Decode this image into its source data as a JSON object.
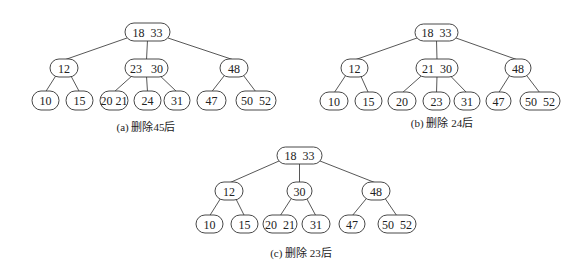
{
  "figure": {
    "trees": [
      {
        "id": "a",
        "caption": "(a) 删除45后",
        "caption_pos": [
          146,
          127
        ],
        "nodes": [
          {
            "id": "root",
            "label": "18  33",
            "x": 125,
            "y": 23,
            "w": 45,
            "h": 18
          },
          {
            "id": "n12",
            "label": "12",
            "x": 50,
            "y": 59,
            "w": 28,
            "h": 18
          },
          {
            "id": "n2330",
            "label": "23   30",
            "x": 125,
            "y": 59,
            "w": 43,
            "h": 18
          },
          {
            "id": "n48",
            "label": "48",
            "x": 220,
            "y": 59,
            "w": 28,
            "h": 18
          },
          {
            "id": "l10",
            "label": "10",
            "x": 32,
            "y": 91,
            "w": 27,
            "h": 19
          },
          {
            "id": "l15",
            "label": "15",
            "x": 66,
            "y": 91,
            "w": 27,
            "h": 19
          },
          {
            "id": "l2021",
            "label": "20 21",
            "x": 100,
            "y": 91,
            "w": 28,
            "h": 19
          },
          {
            "id": "l24",
            "label": "24",
            "x": 134,
            "y": 91,
            "w": 27,
            "h": 19
          },
          {
            "id": "l31",
            "label": "31",
            "x": 164,
            "y": 91,
            "w": 26,
            "h": 19
          },
          {
            "id": "l47",
            "label": "47",
            "x": 197,
            "y": 91,
            "w": 29,
            "h": 19
          },
          {
            "id": "l5052",
            "label": "50  52",
            "x": 236,
            "y": 91,
            "w": 40,
            "h": 19
          }
        ],
        "edges": [
          [
            "root",
            "n12"
          ],
          [
            "root",
            "n2330"
          ],
          [
            "root",
            "n48"
          ],
          [
            "n12",
            "l10"
          ],
          [
            "n12",
            "l15"
          ],
          [
            "n2330",
            "l2021"
          ],
          [
            "n2330",
            "l24"
          ],
          [
            "n2330",
            "l31"
          ],
          [
            "n48",
            "l47"
          ],
          [
            "n48",
            "l5052"
          ]
        ]
      },
      {
        "id": "b",
        "caption": "(b) 删除 24后",
        "caption_pos": [
          442,
          123
        ],
        "nodes": [
          {
            "id": "root",
            "label": "18  33",
            "x": 415,
            "y": 24,
            "w": 43,
            "h": 17
          },
          {
            "id": "n12",
            "label": "12",
            "x": 341,
            "y": 59,
            "w": 27,
            "h": 18
          },
          {
            "id": "n2130",
            "label": "21  30",
            "x": 416,
            "y": 59,
            "w": 42,
            "h": 18
          },
          {
            "id": "n48",
            "label": "48",
            "x": 505,
            "y": 59,
            "w": 26,
            "h": 18
          },
          {
            "id": "l10",
            "label": "10",
            "x": 320,
            "y": 92,
            "w": 28,
            "h": 18
          },
          {
            "id": "l15",
            "label": "15",
            "x": 355,
            "y": 92,
            "w": 27,
            "h": 18
          },
          {
            "id": "l20",
            "label": "20",
            "x": 388,
            "y": 92,
            "w": 28,
            "h": 18
          },
          {
            "id": "l23",
            "label": "23",
            "x": 423,
            "y": 92,
            "w": 27,
            "h": 18
          },
          {
            "id": "l31",
            "label": "31",
            "x": 454,
            "y": 92,
            "w": 26,
            "h": 18
          },
          {
            "id": "l47",
            "label": "47",
            "x": 486,
            "y": 92,
            "w": 25,
            "h": 18
          },
          {
            "id": "l5052",
            "label": "50  52",
            "x": 520,
            "y": 92,
            "w": 40,
            "h": 18
          }
        ],
        "edges": [
          [
            "root",
            "n12"
          ],
          [
            "root",
            "n2130"
          ],
          [
            "root",
            "n48"
          ],
          [
            "n12",
            "l10"
          ],
          [
            "n12",
            "l15"
          ],
          [
            "n2130",
            "l20"
          ],
          [
            "n2130",
            "l23"
          ],
          [
            "n2130",
            "l31"
          ],
          [
            "n48",
            "l47"
          ],
          [
            "n48",
            "l5052"
          ]
        ]
      },
      {
        "id": "c",
        "caption": "(c) 删除 23后",
        "caption_pos": [
          301,
          253
        ],
        "nodes": [
          {
            "id": "root",
            "label": "18  33",
            "x": 277,
            "y": 147,
            "w": 45,
            "h": 17
          },
          {
            "id": "n12",
            "label": "12",
            "x": 215,
            "y": 182,
            "w": 28,
            "h": 18
          },
          {
            "id": "n30",
            "label": "30",
            "x": 287,
            "y": 182,
            "w": 25,
            "h": 18
          },
          {
            "id": "n48",
            "label": "48",
            "x": 362,
            "y": 182,
            "w": 28,
            "h": 18
          },
          {
            "id": "l10",
            "label": "10",
            "x": 196,
            "y": 215,
            "w": 27,
            "h": 18
          },
          {
            "id": "l15",
            "label": "15",
            "x": 231,
            "y": 215,
            "w": 27,
            "h": 18
          },
          {
            "id": "l2021",
            "label": "20  21",
            "x": 263,
            "y": 215,
            "w": 34,
            "h": 18
          },
          {
            "id": "l31",
            "label": "31",
            "x": 302,
            "y": 215,
            "w": 28,
            "h": 18
          },
          {
            "id": "l47",
            "label": "47",
            "x": 339,
            "y": 215,
            "w": 26,
            "h": 18
          },
          {
            "id": "l5052",
            "label": "50  52",
            "x": 378,
            "y": 215,
            "w": 38,
            "h": 18
          }
        ],
        "edges": [
          [
            "root",
            "n12"
          ],
          [
            "root",
            "n30"
          ],
          [
            "root",
            "n48"
          ],
          [
            "n12",
            "l10"
          ],
          [
            "n12",
            "l15"
          ],
          [
            "n30",
            "l2021"
          ],
          [
            "n30",
            "l31"
          ],
          [
            "n48",
            "l47"
          ],
          [
            "n48",
            "l5052"
          ]
        ]
      }
    ]
  },
  "captions": {
    "a": "(a) 删除45后",
    "b": "(b) 删除 24后",
    "c": "(c) 删除 23后"
  }
}
